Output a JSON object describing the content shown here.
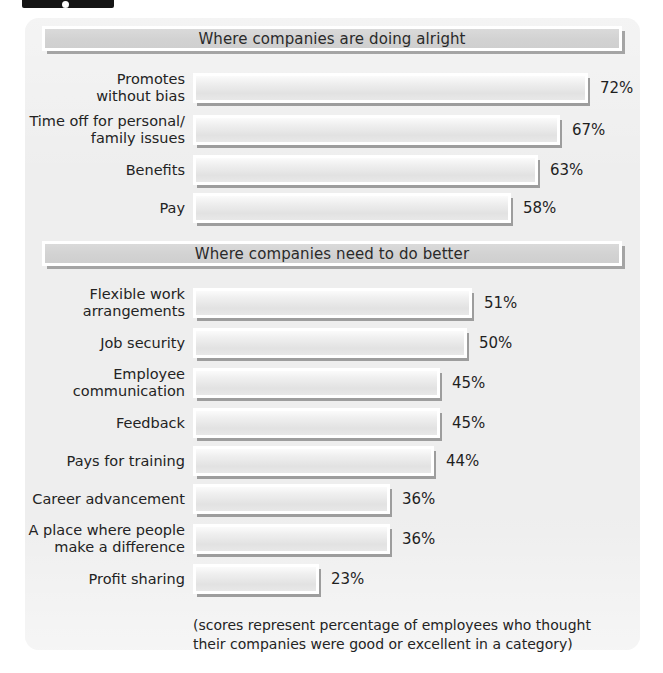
{
  "figure_tab": {
    "present": true
  },
  "panel": {
    "background_color": "#eeeeee",
    "bar_fill_color": "#e6e6e6",
    "bar_border_color": "#ffffff",
    "header_color": "#d4d4d4",
    "text_color": "#232323"
  },
  "sections": [
    {
      "header": "Where companies are doing alright",
      "rows": [
        {
          "label_lines": [
            "Promotes",
            "without bias"
          ],
          "label": "Promotes without bias",
          "value": 72,
          "value_label": "72%"
        },
        {
          "label_lines": [
            "Time off for personal/",
            "family issues"
          ],
          "label": "Time off for personal/ family issues",
          "value": 67,
          "value_label": "67%"
        },
        {
          "label_lines": [
            "Benefits"
          ],
          "label": "Benefits",
          "value": 63,
          "value_label": "63%"
        },
        {
          "label_lines": [
            "Pay"
          ],
          "label": "Pay",
          "value": 58,
          "value_label": "58%"
        }
      ]
    },
    {
      "header": "Where companies need to do better",
      "rows": [
        {
          "label_lines": [
            "Flexible work",
            "arrangements"
          ],
          "label": "Flexible work arrangements",
          "value": 51,
          "value_label": "51%"
        },
        {
          "label_lines": [
            "Job security"
          ],
          "label": "Job security",
          "value": 50,
          "value_label": "50%"
        },
        {
          "label_lines": [
            "Employee",
            "communication"
          ],
          "label": "Employee communication",
          "value": 45,
          "value_label": "45%"
        },
        {
          "label_lines": [
            "Feedback"
          ],
          "label": "Feedback",
          "value": 45,
          "value_label": "45%"
        },
        {
          "label_lines": [
            "Pays for training"
          ],
          "label": "Pays for training",
          "value": 44,
          "value_label": "44%"
        },
        {
          "label_lines": [
            "Career advancement"
          ],
          "label": "Career advancement",
          "value": 36,
          "value_label": "36%"
        },
        {
          "label_lines": [
            "A place where people",
            "make a difference"
          ],
          "label": "A place where people make a difference",
          "value": 36,
          "value_label": "36%"
        },
        {
          "label_lines": [
            "Profit sharing"
          ],
          "label": "Profit sharing",
          "value": 23,
          "value_label": "23%"
        }
      ]
    }
  ],
  "footnote": {
    "line1": "(scores represent percentage of employees who thought",
    "line2": "their companies were good or excellent in a category)"
  },
  "chart_data": {
    "type": "bar",
    "orientation": "horizontal",
    "title": "",
    "subtitle": "",
    "xlabel": "",
    "ylabel": "",
    "xlim": [
      0,
      100
    ],
    "grid": false,
    "legend": "none",
    "value_suffix": "%",
    "groups": [
      {
        "name": "Where companies are doing alright",
        "categories": [
          "Promotes without bias",
          "Time off for personal/ family issues",
          "Benefits",
          "Pay"
        ],
        "values": [
          72,
          67,
          63,
          58
        ]
      },
      {
        "name": "Where companies need to do better",
        "categories": [
          "Flexible work arrangements",
          "Job security",
          "Employee communication",
          "Feedback",
          "Pays for training",
          "Career advancement",
          "A place where people make a difference",
          "Profit sharing"
        ],
        "values": [
          51,
          50,
          45,
          45,
          44,
          36,
          36,
          23
        ]
      }
    ],
    "categories": [
      "Promotes without bias",
      "Time off for personal/ family issues",
      "Benefits",
      "Pay",
      "Flexible work arrangements",
      "Job security",
      "Employee communication",
      "Feedback",
      "Pays for training",
      "Career advancement",
      "A place where people make a difference",
      "Profit sharing"
    ],
    "values": [
      72,
      67,
      63,
      58,
      51,
      50,
      45,
      45,
      44,
      36,
      36,
      23
    ],
    "annotation": "(scores represent percentage of employees who thought their companies were good or excellent in a category)"
  }
}
